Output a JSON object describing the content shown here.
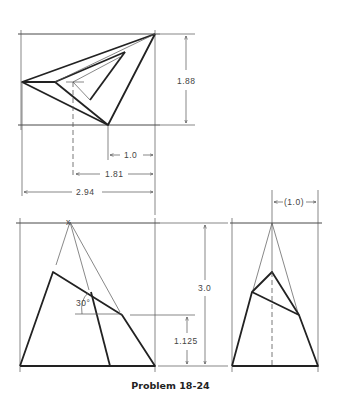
{
  "caption": "Problem 18-24",
  "views": {
    "top": {
      "name": "top-view"
    },
    "front": {
      "name": "front-view"
    },
    "side": {
      "name": "side-view"
    }
  },
  "dimensions": {
    "top_height": "1.88",
    "offset_1": "1.0",
    "offset_2": "1.81",
    "overall_width": "2.94",
    "height": "3.0",
    "cut_height": "1.125",
    "angle": "30°",
    "side_offset": "(1.0)"
  },
  "markers": {
    "apex_mark": "x"
  }
}
